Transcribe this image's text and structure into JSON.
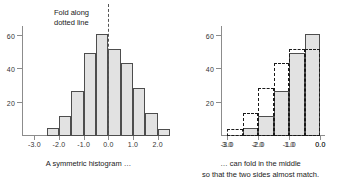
{
  "figure": {
    "panels": [
      {
        "id": "symmetric-histogram",
        "caption": "A symmetric histogram …",
        "annotation_line1": "Fold along",
        "annotation_line2": "dotted line"
      },
      {
        "id": "folded-histogram",
        "caption_line1": "… can fold in the middle",
        "caption_line2": "so that the two sides almost match."
      }
    ]
  },
  "chart_data": [
    {
      "type": "bar",
      "title": "",
      "subtitle": "A symmetric histogram …",
      "xlabel": "",
      "ylabel": "",
      "grid": false,
      "legend": "none",
      "xlim": [
        -3.5,
        2.5
      ],
      "ylim": [
        0,
        66
      ],
      "xticks": [
        "-3.0",
        "-2.0",
        "-1.0",
        "0.0",
        "1.0",
        "2.0"
      ],
      "xtick_values": [
        -3.0,
        -2.0,
        -1.0,
        0.0,
        1.0,
        2.0
      ],
      "yticks": [
        "20",
        "40",
        "60"
      ],
      "ytick_values": [
        20,
        40,
        60
      ],
      "bin_edges": [
        -3.0,
        -2.5,
        -2.0,
        -1.5,
        -1.0,
        -0.5,
        0.0,
        0.5,
        1.0,
        1.5,
        2.0,
        2.5
      ],
      "bin_centers": [
        -2.75,
        -2.25,
        -1.75,
        -1.25,
        -0.75,
        -0.25,
        0.25,
        0.75,
        1.25,
        1.75,
        2.25
      ],
      "categories": [
        "-3.0 to -2.5",
        "-2.5 to -2.0",
        "-2.0 to -1.5",
        "-1.5 to -1.0",
        "-1.0 to -0.5",
        "-0.5 to 0.0",
        "0.0 to 0.5",
        "0.5 to 1.0",
        "1.0 to 1.5",
        "1.5 to 2.0",
        "2.0 to 2.5"
      ],
      "values": [
        0,
        5,
        12,
        27,
        50,
        61,
        52,
        44,
        29,
        14,
        4
      ],
      "annotations": [
        {
          "text": "Fold along dotted line",
          "x": -0.55,
          "y": 66
        },
        {
          "type": "vline",
          "style": "dashed",
          "x": 0.0,
          "label": "fold line"
        }
      ]
    },
    {
      "type": "bar",
      "title": "",
      "subtitle": "… can fold in the middle so that the two sides almost match.",
      "xlabel": "",
      "ylabel": "",
      "grid": false,
      "legend": "none",
      "xlim": [
        -3.2,
        0.15
      ],
      "ylim": [
        0,
        66
      ],
      "xticks": [
        "-3.0",
        "-2.0",
        "-1.0",
        "0.0"
      ],
      "xtick_values": [
        -3.0,
        -2.0,
        -1.0,
        0.0
      ],
      "xtick_mirror_labels": [
        "3.0",
        "2.0",
        "1.0",
        "0.0"
      ],
      "yticks": [
        "20",
        "40",
        "60"
      ],
      "ytick_values": [
        20,
        40,
        60
      ],
      "bin_edges": [
        -3.0,
        -2.5,
        -2.0,
        -1.5,
        -1.0,
        -0.5,
        0.0
      ],
      "bin_centers": [
        -2.75,
        -2.25,
        -1.75,
        -1.25,
        -0.75,
        -0.25
      ],
      "categories": [
        "-3.0 to -2.5",
        "-2.5 to -2.0",
        "-2.0 to -1.5",
        "-1.5 to -1.0",
        "-1.0 to -0.5",
        "-0.5 to 0.0"
      ],
      "series": [
        {
          "name": "left half (solid)",
          "style": "solid-filled",
          "values": [
            0,
            5,
            12,
            27,
            50,
            61
          ]
        },
        {
          "name": "right half folded over (dashed)",
          "style": "dashed-outline",
          "values": [
            4,
            14,
            29,
            44,
            52,
            52
          ]
        }
      ]
    }
  ]
}
